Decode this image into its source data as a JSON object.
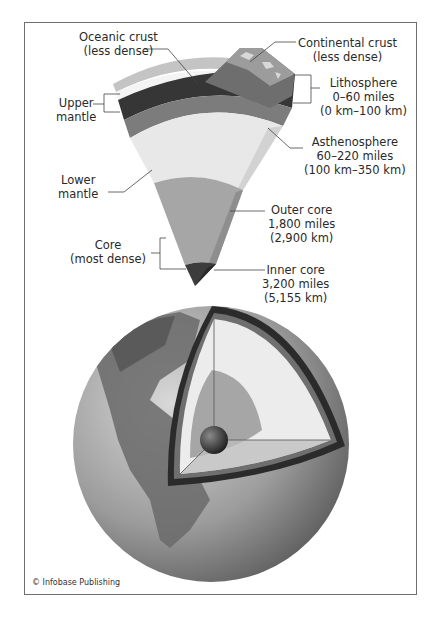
{
  "diagram": {
    "labels": {
      "oceanic_crust": [
        "Oceanic crust",
        "(less dense)"
      ],
      "continental_crust": [
        "Continental crust",
        "(less dense)"
      ],
      "lithosphere": [
        "Lithosphere",
        "0–60 miles",
        "(0 km–100 km)"
      ],
      "upper_mantle": [
        "Upper",
        "mantle"
      ],
      "asthenosphere": [
        "Asthenosphere",
        "60–220 miles",
        "(100 km–350 km)"
      ],
      "lower_mantle": [
        "Lower",
        "mantle"
      ],
      "outer_core": [
        "Outer core",
        "1,800 miles",
        "(2,900 km)"
      ],
      "core": [
        "Core",
        "(most dense)"
      ],
      "inner_core": [
        "Inner core",
        "3,200 miles",
        "(5,155 km)"
      ]
    },
    "colors": {
      "crust_light": "#c9c9c9",
      "crust_white": "#f2f2f2",
      "lithosphere": "#3a3a3a",
      "upper_mantle": "#7a7a7a",
      "lower_mantle": "#e6e6e6",
      "outer_core": "#a8a8a8",
      "inner_core": "#3c3c3c",
      "globe": "#9a9a9a"
    },
    "credit": "© Infobase Publishing"
  }
}
